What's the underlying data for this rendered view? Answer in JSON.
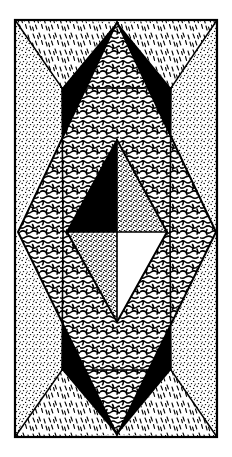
{
  "figure": {
    "canvas": {
      "width": 232,
      "height": 457
    },
    "colors": {
      "ink": "#000000",
      "paper": "#ffffff",
      "solid_fill": "#000000"
    },
    "frame": {
      "name": "outer-border",
      "x": 15,
      "y": 20,
      "width": 202,
      "height": 417,
      "stroke_width": 2.2
    },
    "shapes": [
      {
        "id": "corner-tri-top-left",
        "label": "Top-left corner triangle",
        "fill": "stipple-fine",
        "points": "15,20 15,232 117,22"
      },
      {
        "id": "corner-tri-top-right",
        "label": "Top-right corner triangle",
        "fill": "stipple-fine",
        "points": "117,22 217,20 217,232"
      },
      {
        "id": "corner-tri-bottom-left",
        "label": "Bottom-left corner triangle",
        "fill": "stipple-fine",
        "points": "15,232 117,435 15,437"
      },
      {
        "id": "corner-tri-bottom-right",
        "label": "Bottom-right corner triangle",
        "fill": "stipple-fine",
        "points": "117,435 217,232 217,437"
      },
      {
        "id": "lens-top-left",
        "label": "Upper-left dash-hatch lens",
        "fill": "dash-hatch",
        "points": "15,20 117,22 62,88"
      },
      {
        "id": "lens-top-right",
        "label": "Upper-right dash-hatch lens",
        "fill": "dash-hatch",
        "points": "117,22 217,20 171,88"
      },
      {
        "id": "lens-bottom-left",
        "label": "Lower-left dash-hatch lens",
        "fill": "dash-hatch",
        "points": "15,437 117,435 62,370"
      },
      {
        "id": "lens-bottom-right",
        "label": "Lower-right dash-hatch lens",
        "fill": "dash-hatch",
        "points": "117,435 217,437 171,370"
      },
      {
        "id": "wedge-upper-left",
        "label": "Upper-left solid black wedge",
        "fill": "solid-black",
        "points": "62,88 117,22 63,232"
      },
      {
        "id": "wedge-upper-right",
        "label": "Upper-right solid black wedge",
        "fill": "solid-black",
        "points": "171,88 117,22 170,232"
      },
      {
        "id": "wedge-lower-left",
        "label": "Lower-left solid black wedge",
        "fill": "solid-black",
        "points": "62,370 117,435 63,232"
      },
      {
        "id": "wedge-lower-right",
        "label": "Lower-right solid black wedge",
        "fill": "solid-black",
        "points": "171,370 117,435 170,232"
      },
      {
        "id": "main-rhombus",
        "label": "Large central rhombus with worm texture",
        "fill": "worm-texture",
        "points": "117,22 216,232 117,435 18,232"
      },
      {
        "id": "inner-quad-top-left",
        "label": "Inner rhombus quadrant, top-left (solid black)",
        "fill": "solid-black",
        "points": "117,140 117,232 67,232"
      },
      {
        "id": "inner-quad-top-right",
        "label": "Inner rhombus quadrant, top-right (coarse dots)",
        "fill": "stipple-coarse",
        "points": "117,140 167,232 117,232"
      },
      {
        "id": "inner-quad-bottom-left",
        "label": "Inner rhombus quadrant, bottom-left (coarse dots)",
        "fill": "stipple-coarse",
        "points": "67,232 117,232 117,322"
      },
      {
        "id": "inner-quad-bottom-right",
        "label": "Inner rhombus quadrant, bottom-right (blank white)",
        "fill": "paper-white",
        "points": "117,232 167,232 117,322"
      }
    ],
    "guides": [
      {
        "id": "rhombus-outline",
        "points": "117,22 216,232 117,435 18,232"
      },
      {
        "id": "inner-rhombus-outline",
        "points": "117,140 167,232 117,322 67,232"
      },
      {
        "id": "inner-horizontal-axis",
        "x1": 67,
        "y1": 232,
        "x2": 167,
        "y2": 232
      },
      {
        "id": "inner-vertical-axis",
        "x1": 117,
        "y1": 140,
        "x2": 117,
        "y2": 322
      },
      {
        "id": "diag-top-left",
        "x1": 15,
        "y1": 20,
        "x2": 62,
        "y2": 88
      },
      {
        "id": "diag-top-right",
        "x1": 217,
        "y1": 20,
        "x2": 171,
        "y2": 88
      },
      {
        "id": "diag-bottom-left",
        "x1": 15,
        "y1": 437,
        "x2": 62,
        "y2": 370
      },
      {
        "id": "diag-bottom-right",
        "x1": 217,
        "y1": 437,
        "x2": 171,
        "y2": 370
      },
      {
        "id": "chord-top-left",
        "x1": 62,
        "y1": 88,
        "x2": 117,
        "y2": 88
      },
      {
        "id": "chord-top-right",
        "x1": 117,
        "y1": 88,
        "x2": 171,
        "y2": 88
      },
      {
        "id": "chord-bottom-left",
        "x1": 62,
        "y1": 370,
        "x2": 117,
        "y2": 370
      },
      {
        "id": "chord-bottom-right",
        "x1": 117,
        "y1": 370,
        "x2": 171,
        "y2": 370
      },
      {
        "id": "wedge-inner-left-up",
        "x1": 62,
        "y1": 88,
        "x2": 63,
        "y2": 232
      },
      {
        "id": "wedge-inner-right-up",
        "x1": 171,
        "y1": 88,
        "x2": 170,
        "y2": 232
      },
      {
        "id": "wedge-inner-left-dn",
        "x1": 62,
        "y1": 370,
        "x2": 63,
        "y2": 232
      },
      {
        "id": "wedge-inner-right-dn",
        "x1": 171,
        "y1": 370,
        "x2": 170,
        "y2": 232
      }
    ]
  }
}
